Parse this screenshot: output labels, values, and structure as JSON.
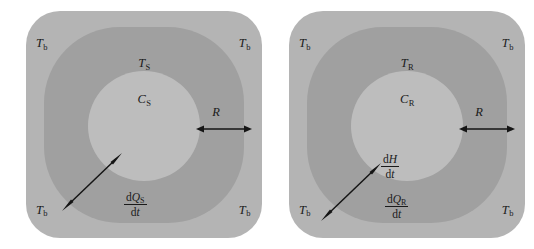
{
  "figure": {
    "name": "thermal-lumped-capacitance-two-panel-diagram",
    "background_color": "#ffffff"
  },
  "colors": {
    "outer_region": "#b4b4b4",
    "middle_region": "#a0a0a0",
    "inner_region": "#bdbdbd",
    "stroke": "#151515",
    "text": "#1a1a1a"
  },
  "panels": [
    {
      "id": "left",
      "name": "sample-panel",
      "corner_labels": {
        "top_left": "T",
        "top_left_sub": "b",
        "top_right": "T",
        "top_right_sub": "b",
        "bottom_left": "T",
        "bottom_left_sub": "b",
        "bottom_right": "T",
        "bottom_right_sub": "b"
      },
      "middle_label": {
        "symbol": "T",
        "sub": "S"
      },
      "inner_label": {
        "symbol": "C",
        "sub": "S"
      },
      "radius_label": "R",
      "flux_fraction": {
        "numerator_d": "d",
        "numerator_symbol": "Q",
        "numerator_sub": "S",
        "denominator_d": "d",
        "denominator_symbol": "t"
      }
    },
    {
      "id": "right",
      "name": "reference-panel",
      "corner_labels": {
        "top_left": "T",
        "top_left_sub": "b",
        "top_right": "T",
        "top_right_sub": "b",
        "bottom_left": "T",
        "bottom_left_sub": "b",
        "bottom_right": "T",
        "bottom_right_sub": "b"
      },
      "middle_label": {
        "symbol": "T",
        "sub": "R"
      },
      "inner_label": {
        "symbol": "C",
        "sub": "R"
      },
      "radius_label": "R",
      "enthalpy_fraction": {
        "numerator_d": "d",
        "numerator_symbol": "H",
        "denominator_d": "d",
        "denominator_symbol": "t"
      },
      "flux_fraction": {
        "numerator_d": "d",
        "numerator_symbol": "Q",
        "numerator_sub": "R",
        "denominator_d": "d",
        "denominator_symbol": "t"
      }
    }
  ]
}
